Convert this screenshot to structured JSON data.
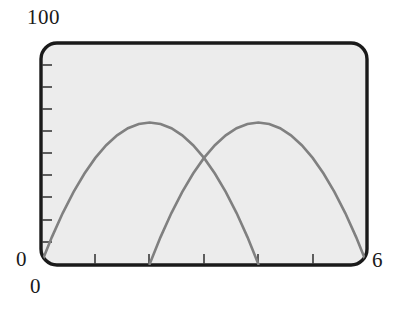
{
  "figure": {
    "background_color": "#ffffff",
    "plot_area_color": "#ececec",
    "frame_color": "#1a1a1a",
    "curve_color": "#808080",
    "tick_color": "#3a3a3a"
  },
  "labels": {
    "y_max": "100",
    "y_min": "0",
    "x_min": "0",
    "x_max": "6"
  },
  "chart_data": {
    "type": "line",
    "title": "",
    "xlabel": "",
    "ylabel": "",
    "xlim": [
      0,
      6
    ],
    "ylim": [
      0,
      100
    ],
    "grid": false,
    "legend": "none",
    "x_tick_labels": [
      "0",
      "6"
    ],
    "y_tick_labels": [
      "0",
      "100"
    ],
    "x_minor_ticks": [
      1,
      2,
      3,
      4,
      5
    ],
    "y_minor_ticks": [
      10,
      20,
      30,
      40,
      50,
      60,
      70,
      80,
      90
    ],
    "series": [
      {
        "name": "curve-left",
        "color": "#808080",
        "peak_x": 2,
        "peak_y": 64,
        "roots": [
          0,
          4
        ],
        "x": [
          0,
          0.2,
          0.4,
          0.6,
          0.8,
          1,
          1.2,
          1.4,
          1.6,
          1.8,
          2,
          2.2,
          2.4,
          2.6,
          2.8,
          3,
          3.2,
          3.4,
          3.6,
          3.8,
          4
        ],
        "values": [
          0,
          12.16,
          23.04,
          32.64,
          40.96,
          48,
          53.76,
          58.24,
          61.44,
          63.36,
          64,
          63.36,
          61.44,
          58.24,
          53.76,
          48,
          40.96,
          32.64,
          23.04,
          12.16,
          0
        ]
      },
      {
        "name": "curve-right",
        "color": "#808080",
        "peak_x": 4,
        "peak_y": 64,
        "roots": [
          2,
          6
        ],
        "x": [
          2,
          2.2,
          2.4,
          2.6,
          2.8,
          3,
          3.2,
          3.4,
          3.6,
          3.8,
          4,
          4.2,
          4.4,
          4.6,
          4.8,
          5,
          5.2,
          5.4,
          5.6,
          5.8,
          6
        ],
        "values": [
          0,
          12.16,
          23.04,
          32.64,
          40.96,
          48,
          53.76,
          58.24,
          61.44,
          63.36,
          64,
          63.36,
          61.44,
          58.24,
          53.76,
          48,
          40.96,
          32.64,
          23.04,
          12.16,
          0
        ]
      }
    ],
    "intersection": {
      "x": 3,
      "y": 48
    }
  }
}
